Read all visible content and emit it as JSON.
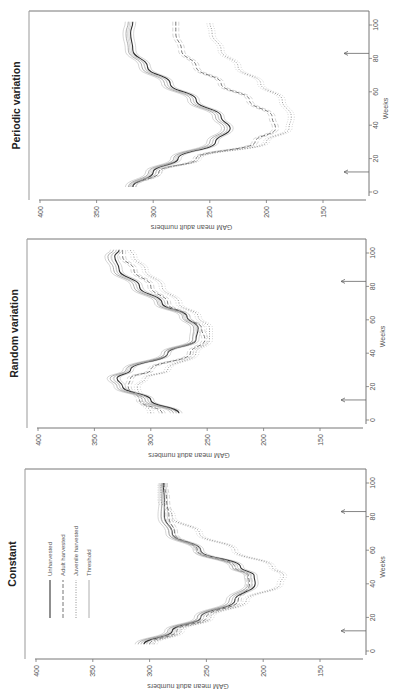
{
  "figure": {
    "orientation": "rotated 90 degrees counter-clockwise",
    "panels": [
      {
        "id": "periodic",
        "title": "Periodic variation"
      },
      {
        "id": "random",
        "title": "Random variation"
      },
      {
        "id": "constant",
        "title": "Constant"
      }
    ],
    "ylabel": "GAM mean adult numbers",
    "xlabel": "Weeks",
    "y_ticks": [
      "400",
      "350",
      "300",
      "250",
      "200",
      "150"
    ],
    "x_ticks": [
      "0",
      "20",
      "40",
      "60",
      "80",
      "100"
    ],
    "legend": [
      "Unharvested",
      "Adult harvested",
      "Juvenile harvested",
      "Threshold"
    ]
  },
  "chart_data": [
    {
      "type": "line",
      "title": "Constant",
      "xlabel": "Weeks",
      "ylabel": "GAM mean adult numbers",
      "xlim": [
        0,
        105
      ],
      "ylim": [
        150,
        400
      ],
      "x_ticks": [
        0,
        20,
        40,
        60,
        80,
        100
      ],
      "y_ticks": [
        150,
        200,
        250,
        300,
        350,
        400
      ],
      "annotations": [
        "arrow at week 12",
        "arrow at week 83"
      ],
      "legend": [
        "Unharvested",
        "Adult harvested",
        "Juvenile harvested",
        "Threshold"
      ],
      "legend_position": "upper left",
      "grid": false,
      "x": [
        4,
        12,
        20,
        30,
        40,
        45,
        50,
        60,
        70,
        80,
        90,
        100
      ],
      "series": [
        {
          "name": "Unharvested",
          "style": "solid",
          "values": [
            305,
            280,
            255,
            225,
            207,
            208,
            220,
            255,
            280,
            287,
            287,
            288
          ]
        },
        {
          "name": "Adult harvested",
          "style": "dashed",
          "values": [
            300,
            276,
            250,
            222,
            212,
            213,
            225,
            258,
            278,
            283,
            285,
            287
          ]
        },
        {
          "name": "Juvenile harvested",
          "style": "dotted",
          "values": [
            296,
            272,
            246,
            215,
            185,
            182,
            192,
            225,
            256,
            280,
            290,
            290
          ]
        },
        {
          "name": "Threshold",
          "style": "solid-light",
          "values": [
            310,
            284,
            258,
            230,
            213,
            214,
            227,
            259,
            283,
            290,
            289,
            289
          ]
        }
      ]
    },
    {
      "type": "line",
      "title": "Random variation",
      "xlabel": "Weeks",
      "ylabel": "GAM mean adult numbers",
      "xlim": [
        0,
        105
      ],
      "ylim": [
        150,
        400
      ],
      "x_ticks": [
        0,
        20,
        40,
        60,
        80,
        100
      ],
      "y_ticks": [
        150,
        200,
        250,
        300,
        350,
        400
      ],
      "annotations": [
        "arrow at week 12",
        "arrow at week 83"
      ],
      "grid": false,
      "x": [
        4,
        12,
        20,
        25,
        30,
        40,
        48,
        55,
        62,
        70,
        80,
        90,
        98,
        102
      ],
      "series": [
        {
          "name": "Unharvested",
          "style": "solid",
          "values": [
            275,
            300,
            325,
            330,
            318,
            285,
            260,
            258,
            268,
            290,
            310,
            328,
            332,
            328
          ]
        },
        {
          "name": "Adult harvested",
          "style": "dashed",
          "values": [
            290,
            310,
            320,
            318,
            300,
            265,
            252,
            255,
            268,
            285,
            300,
            315,
            325,
            325
          ]
        },
        {
          "name": "Juvenile harvested",
          "style": "dotted",
          "values": [
            300,
            308,
            312,
            305,
            285,
            260,
            248,
            248,
            258,
            275,
            290,
            305,
            315,
            318
          ]
        },
        {
          "name": "Threshold",
          "style": "solid-light",
          "values": [
            280,
            305,
            330,
            336,
            322,
            288,
            263,
            262,
            272,
            294,
            315,
            333,
            338,
            333
          ]
        }
      ]
    },
    {
      "type": "line",
      "title": "Periodic variation",
      "xlabel": "Weeks",
      "ylabel": "GAM mean adult numbers",
      "xlim": [
        0,
        105
      ],
      "ylim": [
        150,
        400
      ],
      "x_ticks": [
        0,
        20,
        40,
        60,
        80,
        100
      ],
      "y_ticks": [
        150,
        200,
        250,
        300,
        350,
        400
      ],
      "annotations": [
        "arrow at week 12",
        "arrow at week 83"
      ],
      "grid": false,
      "x": [
        3,
        12,
        20,
        30,
        38,
        45,
        55,
        65,
        75,
        85,
        95,
        102
      ],
      "series": [
        {
          "name": "Unharvested",
          "style": "solid",
          "values": [
            318,
            300,
            278,
            245,
            232,
            240,
            262,
            285,
            305,
            318,
            320,
            318
          ]
        },
        {
          "name": "Adult harvested",
          "style": "dashed",
          "values": [
            318,
            295,
            262,
            210,
            192,
            195,
            215,
            240,
            262,
            275,
            280,
            280
          ]
        },
        {
          "name": "Juvenile harvested",
          "style": "dotted",
          "values": [
            318,
            295,
            260,
            200,
            180,
            178,
            186,
            205,
            225,
            240,
            248,
            250
          ]
        },
        {
          "name": "Threshold",
          "style": "solid-light",
          "values": [
            322,
            304,
            282,
            250,
            237,
            245,
            267,
            290,
            310,
            322,
            324,
            322
          ]
        }
      ]
    }
  ]
}
